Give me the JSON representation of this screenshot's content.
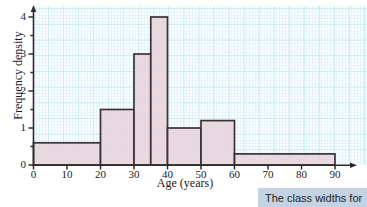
{
  "chart_data": {
    "type": "bar",
    "title": "",
    "xlabel": "Age (years)",
    "ylabel": "Frequency density",
    "xlim": [
      0,
      90
    ],
    "ylim": [
      0,
      4.4
    ],
    "grid": true,
    "legend": null,
    "xticks": [
      "0",
      "10",
      "20",
      "30",
      "40",
      "50",
      "60",
      "70",
      "80",
      "90"
    ],
    "xtick_values": [
      0,
      10,
      20,
      30,
      40,
      50,
      60,
      70,
      80,
      90
    ],
    "yticks": [
      "0",
      "1",
      "2",
      "3",
      "4"
    ],
    "ytick_values": [
      0,
      1,
      2,
      3,
      4
    ],
    "bins": [
      {
        "label": "0-20",
        "start": 0,
        "end": 20,
        "value": 0.6
      },
      {
        "label": "20-30",
        "start": 20,
        "end": 30,
        "value": 1.5
      },
      {
        "label": "30-35",
        "start": 30,
        "end": 35,
        "value": 3.0
      },
      {
        "label": "35-40",
        "start": 35,
        "end": 40,
        "value": 4.0
      },
      {
        "label": "40-50",
        "start": 40,
        "end": 50,
        "value": 1.0
      },
      {
        "label": "50-60",
        "start": 50,
        "end": 60,
        "value": 1.2
      },
      {
        "label": "60-90",
        "start": 60,
        "end": 90,
        "value": 0.3
      }
    ],
    "bar_fill_color": "#e6d2da",
    "bar_edge_color": "#3b3236",
    "axis_color": "#2b2b2b",
    "grid_major_color": "#cfeaf3",
    "grid_minor_color": "#e4f4f9"
  },
  "callout": {
    "text": "The class widths for",
    "background_color": "#c3d3e3"
  }
}
